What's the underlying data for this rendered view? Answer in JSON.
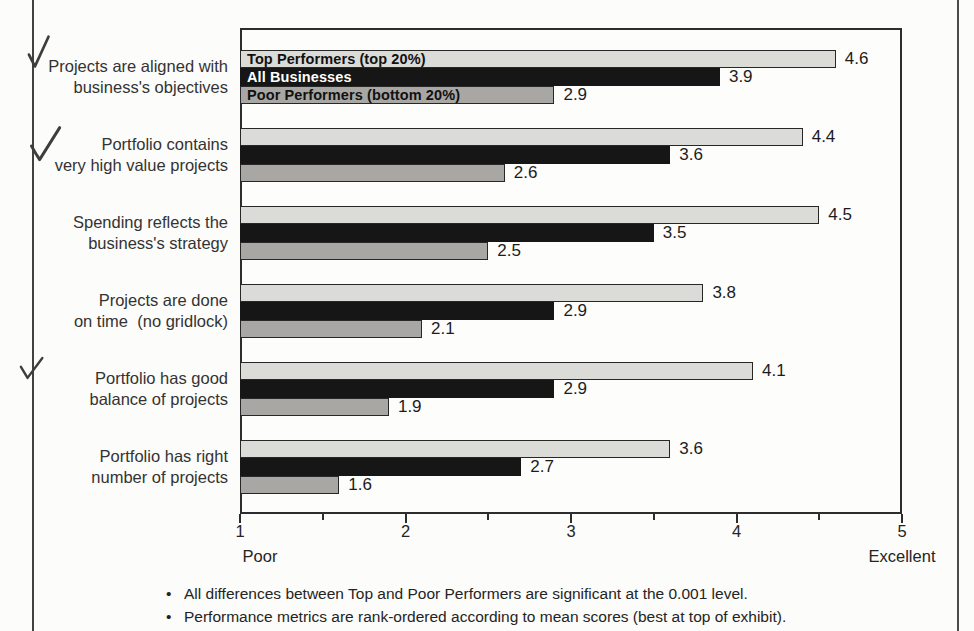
{
  "chart_data": {
    "type": "bar",
    "orientation": "horizontal",
    "xlim": [
      1,
      5
    ],
    "x_ticks": [
      "1",
      "2",
      "3",
      "4",
      "5"
    ],
    "x_minor_ticks": [
      1.5,
      2.5,
      3.5,
      4.5
    ],
    "x_axis_captions": {
      "low": "Poor",
      "high": "Excellent"
    },
    "legend_position": "inside-first-group",
    "value_label_decimals": 1,
    "categories": [
      {
        "label_lines": [
          "Projects are aligned with",
          "business's objectives"
        ],
        "checkmark": true
      },
      {
        "label_lines": [
          "Portfolio contains",
          "very high value projects"
        ],
        "checkmark": true
      },
      {
        "label_lines": [
          "Spending reflects the",
          "business's strategy"
        ],
        "checkmark": false
      },
      {
        "label_lines": [
          "Projects are done",
          "on time  (no gridlock)"
        ],
        "checkmark": false
      },
      {
        "label_lines": [
          "Portfolio has good",
          "balance of projects"
        ],
        "checkmark": true
      },
      {
        "label_lines": [
          "Portfolio has right",
          "number of projects"
        ],
        "checkmark": false
      }
    ],
    "series": [
      {
        "name": "Top Performers (top 20%)",
        "color": "#dbdbd7",
        "label_color": "#111111",
        "bordered": true,
        "values": [
          4.6,
          4.4,
          4.5,
          3.8,
          4.1,
          3.6
        ]
      },
      {
        "name": "All Businesses",
        "color": "#161616",
        "label_color": "#ffffff",
        "bordered": false,
        "values": [
          3.9,
          3.6,
          3.5,
          2.9,
          2.9,
          2.7
        ]
      },
      {
        "name": "Poor Performers (bottom 20%)",
        "color": "#a8a7a3",
        "label_color": "#111111",
        "bordered": true,
        "values": [
          2.9,
          2.6,
          2.5,
          2.1,
          1.9,
          1.6
        ]
      }
    ]
  },
  "footnotes": {
    "bullet_glyph": "•",
    "items": [
      "All differences between Top and Poor Performers are significant at the 0.001 level.",
      "Performance metrics are rank-ordered according to mean scores (best at top of exhibit)."
    ]
  }
}
